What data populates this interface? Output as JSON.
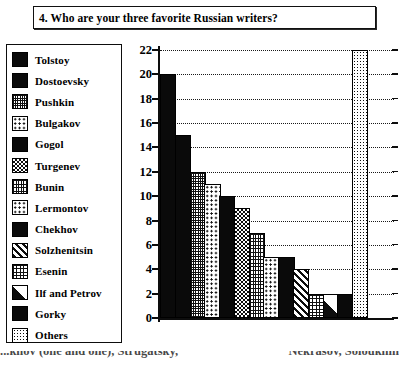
{
  "question": {
    "number": "4.",
    "text": "4. Who are your three favorite Russian writers?"
  },
  "legend": {
    "items": [
      {
        "label": "Tolstoy",
        "pattern": "solid"
      },
      {
        "label": "Dostoevsky",
        "pattern": "solid"
      },
      {
        "label": "Pushkin",
        "pattern": "fine-grid"
      },
      {
        "label": "Bulgakov",
        "pattern": "sparse-dots"
      },
      {
        "label": "Gogol",
        "pattern": "solid"
      },
      {
        "label": "Turgenev",
        "pattern": "checkerboard"
      },
      {
        "label": "Bunin",
        "pattern": "vertical-grid"
      },
      {
        "label": "Lermontov",
        "pattern": "sparse-dots"
      },
      {
        "label": "Chekhov",
        "pattern": "solid"
      },
      {
        "label": "Solzhenitsin",
        "pattern": "diagonal-stripes"
      },
      {
        "label": "Esenin",
        "pattern": "crosshatch"
      },
      {
        "label": "Ilf and Petrov",
        "pattern": "half-diagonal"
      },
      {
        "label": "Gorky",
        "pattern": "solid"
      },
      {
        "label": "Others",
        "pattern": "dot-grid"
      }
    ]
  },
  "chart_data": {
    "type": "bar",
    "title": "4. Who are your three favorite Russian writers?",
    "xlabel": "",
    "ylabel": "",
    "ylim": [
      0,
      22
    ],
    "ytick_step": 2,
    "yticks": [
      "0",
      "2",
      "4",
      "6",
      "8",
      "10",
      "12",
      "14",
      "16",
      "18",
      "20",
      "22"
    ],
    "grid": true,
    "grid_style": "dotted-horizontal",
    "legend_position": "left-outside",
    "categories": [
      "Tolstoy",
      "Dostoevsky",
      "Pushkin",
      "Bulgakov",
      "Gogol",
      "Turgenev",
      "Bunin",
      "Lermontov",
      "Chekhov",
      "Solzhenitsin",
      "Esenin",
      "Ilf and Petrov",
      "Gorky",
      "Others"
    ],
    "values": [
      20,
      15,
      12,
      11,
      10,
      9,
      7,
      5,
      5,
      4,
      2,
      2,
      2,
      22
    ],
    "patterns": [
      "solid",
      "solid",
      "fine-grid",
      "sparse-dots",
      "solid",
      "checkerboard",
      "vertical-grid",
      "sparse-dots",
      "solid",
      "diagonal-stripes",
      "crosshatch",
      "half-diagonal",
      "solid",
      "dot-grid"
    ],
    "colors": {
      "ink": "#0d0d0d",
      "background": "#ffffff"
    }
  },
  "footer": {
    "cut_text_left": "...khov  (one and one),  Strugatsky,",
    "cut_text_right": "Nekrasov,   Soloukhin"
  }
}
